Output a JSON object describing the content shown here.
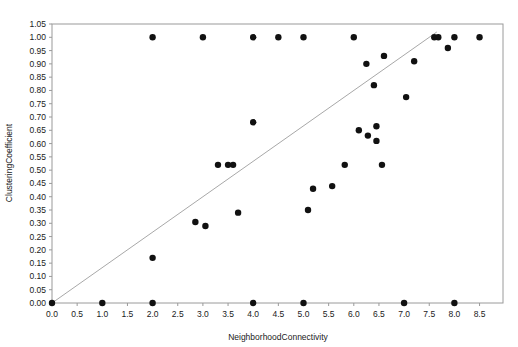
{
  "chart_data": {
    "type": "scatter",
    "title": "",
    "xlabel": "NeighborhoodConnectivity",
    "ylabel": "ClusteringCoefficient",
    "xlim": [
      0.0,
      8.75
    ],
    "ylim": [
      0.0,
      1.05
    ],
    "grid": false,
    "legend": null,
    "xticks": [
      "0.0",
      "0.5",
      "1.0",
      "1.5",
      "2.0",
      "2.5",
      "3.0",
      "3.5",
      "4.0",
      "4.5",
      "5.0",
      "5.5",
      "6.0",
      "6.5",
      "7.0",
      "7.5",
      "8.0",
      "8.5"
    ],
    "xtick_values": [
      0.0,
      0.5,
      1.0,
      1.5,
      2.0,
      2.5,
      3.0,
      3.5,
      4.0,
      4.5,
      5.0,
      5.5,
      6.0,
      6.5,
      7.0,
      7.5,
      8.0,
      8.5
    ],
    "yticks": [
      "0.00",
      "0.05",
      "0.10",
      "0.15",
      "0.20",
      "0.25",
      "0.30",
      "0.35",
      "0.40",
      "0.45",
      "0.50",
      "0.55",
      "0.60",
      "0.65",
      "0.70",
      "0.75",
      "0.80",
      "0.85",
      "0.90",
      "0.95",
      "1.00",
      "1.05"
    ],
    "ytick_values": [
      0.0,
      0.05,
      0.1,
      0.15,
      0.2,
      0.25,
      0.3,
      0.35,
      0.4,
      0.45,
      0.5,
      0.55,
      0.6,
      0.65,
      0.7,
      0.75,
      0.8,
      0.85,
      0.9,
      0.95,
      1.0,
      1.05
    ],
    "marker": {
      "shape": "circle",
      "size": 3.2,
      "color": "#111111"
    },
    "reference_line": {
      "description": "diagonal trend line from origin",
      "color": "#a8a8a8",
      "x": [
        0.0,
        7.65
      ],
      "y": [
        0.0,
        1.02
      ]
    },
    "points": [
      {
        "x": 0.0,
        "y": 0.0
      },
      {
        "x": 1.0,
        "y": 0.0
      },
      {
        "x": 2.0,
        "y": 0.0
      },
      {
        "x": 4.0,
        "y": 0.0
      },
      {
        "x": 5.0,
        "y": 0.0
      },
      {
        "x": 7.0,
        "y": 0.0
      },
      {
        "x": 8.0,
        "y": 0.0
      },
      {
        "x": 2.0,
        "y": 0.17
      },
      {
        "x": 2.85,
        "y": 0.305
      },
      {
        "x": 3.05,
        "y": 0.29
      },
      {
        "x": 3.7,
        "y": 0.34
      },
      {
        "x": 3.3,
        "y": 0.52
      },
      {
        "x": 3.5,
        "y": 0.52
      },
      {
        "x": 3.6,
        "y": 0.52
      },
      {
        "x": 4.0,
        "y": 0.68
      },
      {
        "x": 2.0,
        "y": 1.0
      },
      {
        "x": 3.0,
        "y": 1.0
      },
      {
        "x": 4.0,
        "y": 1.0
      },
      {
        "x": 4.5,
        "y": 1.0
      },
      {
        "x": 5.0,
        "y": 1.0
      },
      {
        "x": 5.09,
        "y": 0.35
      },
      {
        "x": 5.19,
        "y": 0.43
      },
      {
        "x": 5.57,
        "y": 0.44
      },
      {
        "x": 5.82,
        "y": 0.52
      },
      {
        "x": 6.0,
        "y": 1.0
      },
      {
        "x": 6.1,
        "y": 0.65
      },
      {
        "x": 6.28,
        "y": 0.63
      },
      {
        "x": 6.45,
        "y": 0.665
      },
      {
        "x": 6.45,
        "y": 0.61
      },
      {
        "x": 6.25,
        "y": 0.9
      },
      {
        "x": 6.4,
        "y": 0.82
      },
      {
        "x": 6.56,
        "y": 0.52
      },
      {
        "x": 6.6,
        "y": 0.93
      },
      {
        "x": 7.04,
        "y": 0.775
      },
      {
        "x": 7.2,
        "y": 0.91
      },
      {
        "x": 7.6,
        "y": 1.0
      },
      {
        "x": 7.68,
        "y": 1.0
      },
      {
        "x": 7.87,
        "y": 0.96
      },
      {
        "x": 8.0,
        "y": 1.0
      },
      {
        "x": 8.5,
        "y": 1.0
      }
    ]
  }
}
